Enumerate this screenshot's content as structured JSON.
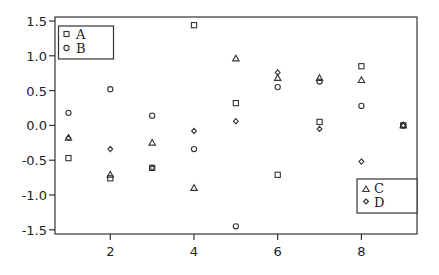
{
  "chart_data": {
    "type": "scatter",
    "title": "",
    "xlabel": "",
    "ylabel": "",
    "x": [
      1,
      2,
      3,
      4,
      5,
      6,
      7,
      8,
      9
    ],
    "xlim": [
      0.7,
      9.3
    ],
    "ylim": [
      -1.55,
      1.55
    ],
    "xticks": [
      2,
      4,
      6,
      8
    ],
    "xtick_labels": [
      "2",
      "4",
      "6",
      "8"
    ],
    "yticks": [
      1.5,
      1.0,
      0.5,
      0.0,
      -0.5,
      -1.0,
      -1.5
    ],
    "ytick_labels": [
      "1.5",
      "1.0",
      "0.5",
      "0.0",
      "-0.5",
      "-1.0",
      "-1.5"
    ],
    "grid": false,
    "series": [
      {
        "name": "A",
        "marker": "square",
        "values": [
          -0.47,
          -0.76,
          -0.61,
          1.44,
          0.32,
          -0.71,
          0.05,
          0.85,
          0.0
        ]
      },
      {
        "name": "B",
        "marker": "circle",
        "values": [
          0.18,
          0.52,
          0.14,
          -0.34,
          -1.45,
          0.55,
          0.63,
          0.28,
          0.0
        ]
      },
      {
        "name": "C",
        "marker": "triangle",
        "values": [
          -0.18,
          -0.71,
          -0.25,
          -0.9,
          0.96,
          0.68,
          0.68,
          0.65,
          0.0
        ]
      },
      {
        "name": "D",
        "marker": "diamond",
        "values": [
          -0.18,
          -0.34,
          -0.61,
          -0.08,
          0.06,
          0.76,
          -0.05,
          -0.52,
          0.0
        ]
      }
    ],
    "legends": [
      {
        "position": "top-left",
        "entries": [
          "A",
          "B"
        ]
      },
      {
        "position": "bottom-right",
        "entries": [
          "C",
          "D"
        ]
      }
    ]
  },
  "legend_top": {
    "A": "A",
    "B": "B"
  },
  "legend_bottom": {
    "C": "C",
    "D": "D"
  }
}
